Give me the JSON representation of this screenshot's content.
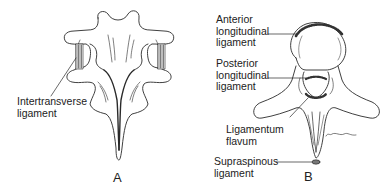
{
  "figure": {
    "panels": [
      {
        "id": "A",
        "letter": "A",
        "view": "posterior view of vertebrae",
        "labels": [
          {
            "text": "Intertransverse\nligament",
            "target": "intertransverse-ligament"
          }
        ]
      },
      {
        "id": "B",
        "letter": "B",
        "view": "superior view of vertebra",
        "labels": [
          {
            "text": "Anterior\nlongitudinal\nligament",
            "target": "anterior-longitudinal-ligament"
          },
          {
            "text": "Posterior\nlongitudinal\nligament",
            "target": "posterior-longitudinal-ligament"
          },
          {
            "text": "Ligamentum\nflavum",
            "target": "ligamentum-flavum"
          },
          {
            "text": "Supraspinous\nligament",
            "target": "supraspinous-ligament"
          }
        ],
        "signature": "F. Forsdan"
      }
    ]
  },
  "colors": {
    "line": "#2a2a2a",
    "ligament_fill": "#555555",
    "background": "#ffffff"
  }
}
